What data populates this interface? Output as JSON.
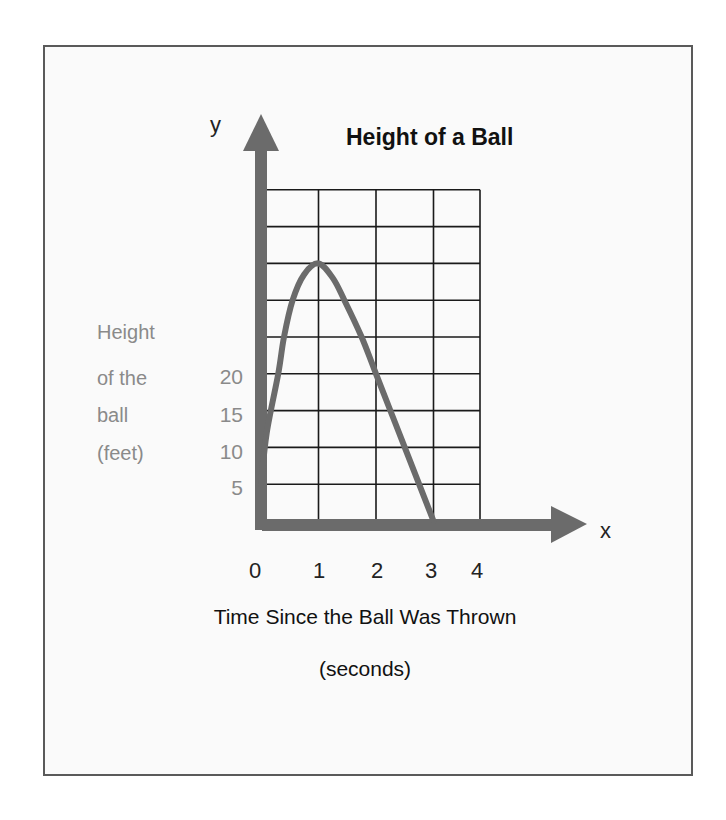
{
  "chart_data": {
    "type": "line",
    "title": "Height of a Ball",
    "xlabel": "Time Since the Ball Was Thrown (seconds)",
    "xlabel_lines": [
      "Time Since the Ball Was Thrown",
      "(seconds)"
    ],
    "ylabel": "Height of the ball (feet)",
    "ylabel_lines": [
      "Height",
      "of the",
      "ball",
      "(feet)"
    ],
    "x_axis_letter": "x",
    "y_axis_letter": "y",
    "x_ticks": [
      "0",
      "1",
      "2",
      "3",
      "4"
    ],
    "y_ticks": [
      "5",
      "10",
      "15",
      "20"
    ],
    "xlim": [
      0,
      4
    ],
    "ylim": [
      0,
      45
    ],
    "grid": true,
    "grid_x_step": 1,
    "grid_y_step": 5,
    "series": [
      {
        "name": "Height of a Ball",
        "x": [
          0,
          0.1,
          0.3,
          0.4,
          0.55,
          0.75,
          1.0,
          1.25,
          1.45,
          1.75,
          2.0,
          2.5,
          3.0
        ],
        "y": [
          5,
          12,
          20,
          25,
          30,
          33.5,
          35,
          33,
          30,
          25,
          20,
          10,
          0
        ]
      }
    ],
    "peak": {
      "x": 1,
      "y": 35
    },
    "colors": {
      "curve": "#6b6b6b",
      "axes": "#6b6b6b",
      "grid": "#1a1a1a"
    }
  }
}
